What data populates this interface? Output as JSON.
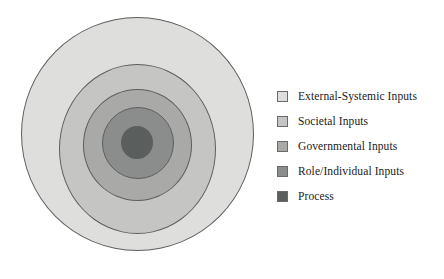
{
  "diagram": {
    "type": "concentric-circles",
    "title": "",
    "layers": [
      {
        "label": "External-Systemic Inputs",
        "color": "#dededc",
        "level": 1
      },
      {
        "label": "Societal Inputs",
        "color": "#c5c6c4",
        "level": 2
      },
      {
        "label": "Governmental Inputs",
        "color": "#a9aaa8",
        "level": 3
      },
      {
        "label": "Role/Individual Inputs",
        "color": "#8a8d8b",
        "level": 4
      },
      {
        "label": "Process",
        "color": "#5a5e5c",
        "level": 5
      }
    ],
    "outline_color": "#5e5e5e",
    "background": "#ffffff"
  },
  "legend": {
    "position": "right",
    "items": [
      {
        "label": "External-Systemic Inputs",
        "color": "#dededc"
      },
      {
        "label": "Societal Inputs",
        "color": "#c5c6c4"
      },
      {
        "label": "Governmental Inputs",
        "color": "#a9aaa8"
      },
      {
        "label": "Role/Individual Inputs",
        "color": "#8a8d8b"
      },
      {
        "label": "Process",
        "color": "#5a5e5c"
      }
    ]
  }
}
